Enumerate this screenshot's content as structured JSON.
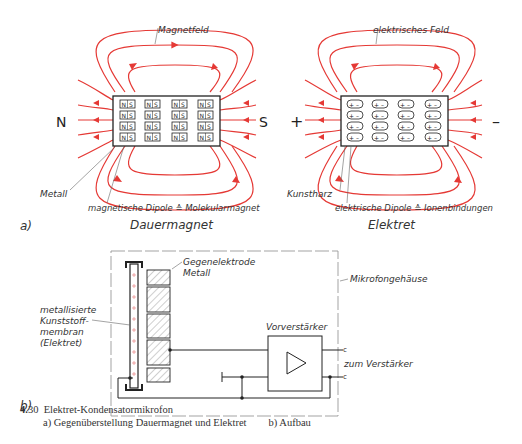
{
  "figure": {
    "colors": {
      "field_lines": "#e53935",
      "line": "#222222",
      "text": "#333333",
      "housing_dash": "#999999"
    },
    "part_a": {
      "label": "a)",
      "magnet": {
        "title": "Dauermagnet",
        "field_label": "Magnetfeld",
        "pole_left": "N",
        "pole_right": "S",
        "material_label": "Metall",
        "dipole_label": "magnetische Dipole ≙ Molekularmagnet",
        "dipole_glyph_left": "N",
        "dipole_glyph_right": "S",
        "grid_rows": 4,
        "grid_cols": 4
      },
      "electret": {
        "title": "Elektret",
        "field_label": "elektrisches Feld",
        "pole_left": "+",
        "pole_right": "–",
        "material_label": "Kunstharz",
        "dipole_label": "elektrische Dipole ≙ Ionenbindungen",
        "dipole_glyph_left": "+",
        "dipole_glyph_right": "–",
        "grid_rows": 4,
        "grid_cols": 4
      }
    },
    "part_b": {
      "label": "b)",
      "counter_electrode_label_1": "Gegenelektrode",
      "counter_electrode_label_2": "Metall",
      "membrane_label_1": "metallisierte",
      "membrane_label_2": "Kunststoff-",
      "membrane_label_3": "membran",
      "membrane_label_4": "(Elektret)",
      "housing_label": "Mikrofongehäuse",
      "preamp_label": "Vorverstärker",
      "output_label": "zum Verstärker",
      "terminal_glyph": "c"
    },
    "caption": {
      "number": "4.",
      "number_rest": "30",
      "title": "Elektret-Kondensatormikrofon",
      "sub_a": "a) Gegenüberstellung Dauermagnet und Elektret",
      "sub_b": "b) Aufbau"
    }
  }
}
